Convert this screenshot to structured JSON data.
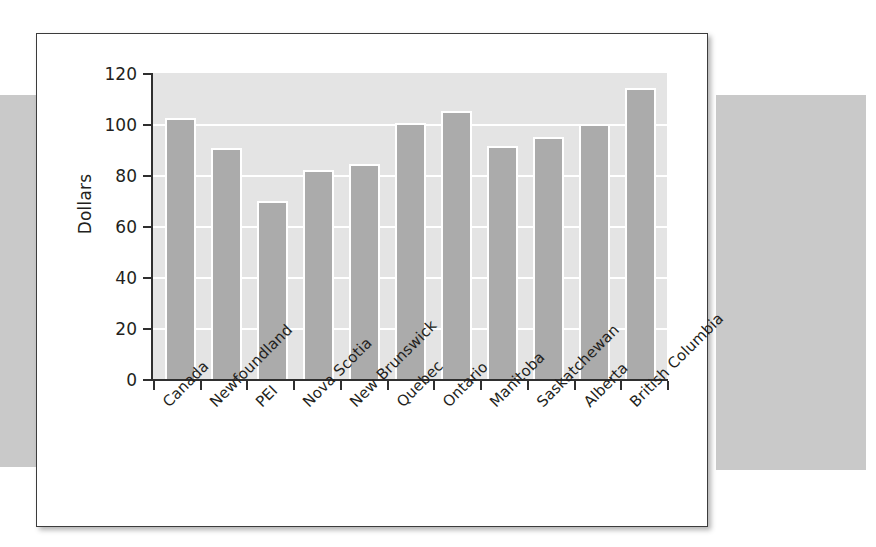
{
  "figure": {
    "background_color": "#ffffff",
    "border_color": "#3c3c3c",
    "band_color": "#c9c9c9",
    "plot_background_color": "#e4e4e4",
    "bar_color": "#ababab",
    "bar_outline_color": "#ffffff",
    "gridline_color": "#ffffff",
    "axis_color": "#2f2f2f",
    "text_color": "#231f20"
  },
  "chart_data": {
    "type": "bar",
    "title": "",
    "subtitle": "",
    "xlabel": "",
    "ylabel": "Dollars",
    "ylim": [
      0,
      120
    ],
    "ytick_values": [
      120,
      100,
      80,
      60,
      40,
      20,
      0
    ],
    "ytick_labels": [
      "120",
      "100",
      "80",
      "60",
      "40",
      "20",
      "0"
    ],
    "ytick_step": 20,
    "grid": true,
    "grid_axis": "y",
    "legend": false,
    "legend_position": "none",
    "xtick_label_rotation": -45,
    "categories": [
      "Canada",
      "Newfoundland",
      "PEI",
      "Nova Scotia",
      "New Brunswick",
      "Quebec",
      "Ontario",
      "Manitoba",
      "Saskatchewan",
      "Alberta",
      "British Columbia"
    ],
    "values": [
      102.5,
      90.5,
      70,
      82,
      84.5,
      100.5,
      105,
      91.5,
      95,
      100,
      114
    ],
    "annotations": []
  }
}
